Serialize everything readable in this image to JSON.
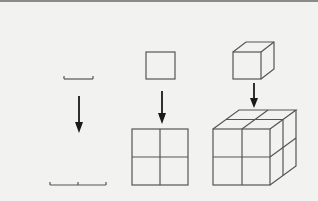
{
  "diagram": {
    "colors": {
      "background": "#f2f2f1",
      "stroke": "#555555",
      "arrow": "#1a1a1a",
      "top_border": "#8a8a8a"
    },
    "panels": [
      {
        "id": "one-dimension",
        "source": "line segment",
        "result": "line segment doubled (2 units)"
      },
      {
        "id": "two-dimension",
        "source": "square",
        "result": "2x2 square grid"
      },
      {
        "id": "three-dimension",
        "source": "cube",
        "result": "2x2x2 cube"
      }
    ]
  }
}
